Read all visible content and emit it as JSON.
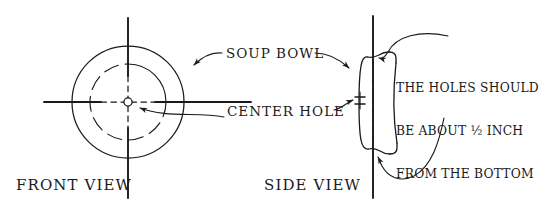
{
  "drawing": {
    "title": "Soup bowl drilling guide",
    "ink_color": "#1a1a1a",
    "background_color": "#ffffff"
  },
  "captions": {
    "front_view": "FRONT VIEW",
    "side_view": "SIDE VIEW"
  },
  "callouts": {
    "soup_bowl": "SOUP BOWL",
    "center_hole": "CENTER HOLE"
  },
  "note": {
    "line1": "THE HOLES SHOULD",
    "line2": "BE ABOUT ½ INCH",
    "line3": "FROM THE BOTTOM",
    "line4": "OF THE BOWL."
  }
}
